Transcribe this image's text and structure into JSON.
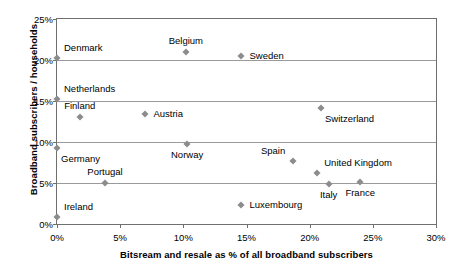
{
  "chart_data": {
    "type": "scatter",
    "title": "",
    "xlabel": "Bitsream and resale as % of all broadband subscribers",
    "ylabel": "Broadband subscribers / households",
    "xlim": [
      0,
      30
    ],
    "ylim": [
      0,
      25
    ],
    "grid": "horizontal",
    "legend": "none",
    "xticks": [
      "0%",
      "5%",
      "10%",
      "15%",
      "20%",
      "25%",
      "30%"
    ],
    "xtick_values": [
      0,
      5,
      10,
      15,
      20,
      25,
      30
    ],
    "yticks": [
      "0%",
      "5%",
      "10%",
      "15%",
      "20%",
      "25%"
    ],
    "ytick_values": [
      0,
      5,
      10,
      15,
      20,
      25
    ],
    "marker_color": "#8c8c8c",
    "points": [
      {
        "label": "Denmark",
        "x": 0.0,
        "y": 20.3,
        "label_pos": "right-above"
      },
      {
        "label": "Netherlands",
        "x": 0.0,
        "y": 15.2,
        "label_pos": "right-above"
      },
      {
        "label": "Germany",
        "x": 0.0,
        "y": 9.3,
        "label_pos": "right-below"
      },
      {
        "label": "Ireland",
        "x": 0.0,
        "y": 0.8,
        "label_pos": "right-above"
      },
      {
        "label": "Finland",
        "x": 1.8,
        "y": 13.0,
        "label_pos": "above"
      },
      {
        "label": "Portugal",
        "x": 3.8,
        "y": 5.0,
        "label_pos": "above"
      },
      {
        "label": "Austria",
        "x": 7.0,
        "y": 13.4,
        "label_pos": "right"
      },
      {
        "label": "Belgium",
        "x": 10.2,
        "y": 21.0,
        "label_pos": "above"
      },
      {
        "label": "Norway",
        "x": 10.3,
        "y": 9.8,
        "label_pos": "below"
      },
      {
        "label": "Luxembourg",
        "x": 14.6,
        "y": 2.3,
        "label_pos": "right"
      },
      {
        "label": "Sweden",
        "x": 14.6,
        "y": 20.5,
        "label_pos": "right"
      },
      {
        "label": "Spain",
        "x": 18.7,
        "y": 7.7,
        "label_pos": "left-above"
      },
      {
        "label": "United Kingdom",
        "x": 20.6,
        "y": 6.2,
        "label_pos": "right-above"
      },
      {
        "label": "Switzerland",
        "x": 20.9,
        "y": 14.2,
        "label_pos": "right-below"
      },
      {
        "label": "Italy",
        "x": 21.5,
        "y": 4.9,
        "label_pos": "below"
      },
      {
        "label": "France",
        "x": 24.0,
        "y": 5.1,
        "label_pos": "below"
      }
    ]
  }
}
